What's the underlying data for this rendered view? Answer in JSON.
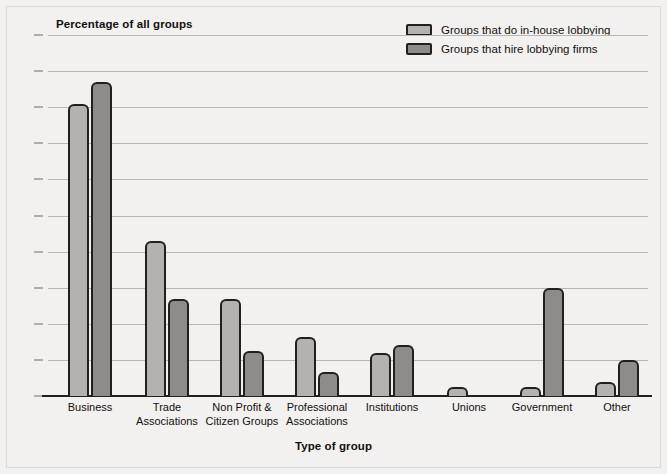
{
  "chart_data": {
    "type": "bar",
    "title": "Percentage of all groups",
    "xlabel": "Type of group",
    "ylabel": "Percentage of all groups",
    "ylim": [
      0,
      50
    ],
    "ytick_step": 5,
    "yticks": [
      "0",
      "5",
      "10",
      "15",
      "20",
      "25",
      "30",
      "35",
      "40",
      "45",
      "50"
    ],
    "grid": true,
    "legend_position": "top-right",
    "categories": [
      "Business",
      "Trade Associations",
      "Non Profit & Citizen Groups",
      "Professional Associations",
      "Institutions",
      "Unions",
      "Government",
      "Other"
    ],
    "category_lines": [
      [
        "Business"
      ],
      [
        "Trade",
        "Associations"
      ],
      [
        "Non Profit &",
        "Citizen Groups"
      ],
      [
        "Professional",
        "Associations"
      ],
      [
        "Institutions"
      ],
      [
        "Unions"
      ],
      [
        "Government"
      ],
      [
        "Other"
      ]
    ],
    "series": [
      {
        "name": "Groups that do in-house lobbying",
        "color": "#b3b2ae",
        "values": [
          40.5,
          21.5,
          13.5,
          8.2,
          6.0,
          1.3,
          1.3,
          2.0
        ]
      },
      {
        "name": "Groups that hire lobbying firms",
        "color": "#8d8c88",
        "values": [
          43.5,
          13.5,
          6.3,
          3.3,
          7.0,
          0,
          15.0,
          5.0
        ]
      }
    ]
  },
  "legend": {
    "items": [
      {
        "label": "Groups that do in-house lobbying"
      },
      {
        "label": "Groups that hire lobbying firms"
      }
    ]
  },
  "colors": {
    "background": "#f2f1ef",
    "series_1": "#b3b2ae",
    "series_2": "#8d8c88",
    "outline": "#231f1e",
    "gridline": "#b9b7b3",
    "text": "#120f0e"
  }
}
